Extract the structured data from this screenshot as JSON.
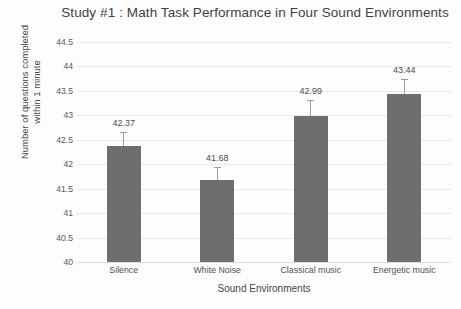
{
  "chart_data": {
    "type": "bar",
    "title": "Study #1 : Math Task Performance in Four Sound Environments",
    "title_line1": "Study #1 : Math Task Performance in Four Sound",
    "title_line2": "Environments",
    "xlabel": "Sound Environments",
    "ylabel": "Number of questions completed within 1 minute",
    "ylabel_line1": "Number of questions completed",
    "ylabel_line2": "within 1 minute",
    "categories": [
      "Silence",
      "White Noise",
      "Classical music",
      "Energetic music"
    ],
    "values": [
      42.37,
      41.68,
      42.99,
      43.44
    ],
    "data_labels": [
      "42.37",
      "41.68",
      "42.99",
      "43.44"
    ],
    "error_upper": [
      0.28,
      0.26,
      0.33,
      0.31
    ],
    "ylim": [
      40,
      44.5
    ],
    "yticks": [
      44.5,
      44,
      43.5,
      43,
      42.5,
      42,
      41.5,
      41,
      40.5,
      40
    ],
    "ytick_labels": [
      "44.5",
      "44",
      "43.5",
      "43",
      "42.5",
      "42",
      "41.5",
      "41",
      "40.5",
      "40"
    ],
    "grid": true,
    "legend": false,
    "bar_color": "#6e6e6e",
    "gridline_color": "#e9e9ea",
    "error_color": "#9b9b9b",
    "background": "#fdfdfd"
  }
}
